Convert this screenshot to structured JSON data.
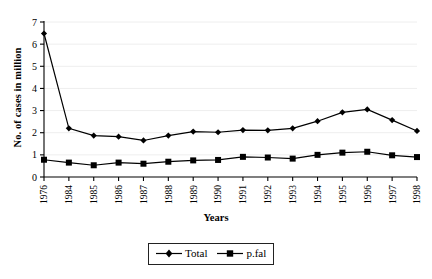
{
  "chart_data": {
    "type": "line",
    "title": "",
    "subtitle": "",
    "xlabel": "Years",
    "ylabel": "No. of cases in million",
    "categories": [
      "1976",
      "1984",
      "1985",
      "1986",
      "1987",
      "1988",
      "1989",
      "1990",
      "1991",
      "1992",
      "1993",
      "1994",
      "1995",
      "1996",
      "1997",
      "1998"
    ],
    "series": [
      {
        "name": "Total",
        "marker": "diamond",
        "color": "#000000",
        "values": [
          6.48,
          2.2,
          1.87,
          1.82,
          1.65,
          1.87,
          2.05,
          2.02,
          2.12,
          2.11,
          2.2,
          2.52,
          2.92,
          3.05,
          2.57,
          2.08
        ]
      },
      {
        "name": "p.fal",
        "marker": "square",
        "color": "#000000",
        "values": [
          0.78,
          0.65,
          0.53,
          0.65,
          0.6,
          0.69,
          0.75,
          0.77,
          0.91,
          0.88,
          0.83,
          1.0,
          1.1,
          1.14,
          0.98,
          0.9
        ]
      }
    ],
    "ylim": [
      0,
      7
    ],
    "yticks": [
      "0",
      "1",
      "2",
      "3",
      "4",
      "5",
      "6",
      "7"
    ],
    "grid": "horizontal-light",
    "legend_position": "bottom-center",
    "axis_color": "#000000",
    "gridline_color": "#eeeeee",
    "background": "#ffffff"
  },
  "legend": {
    "entries": [
      {
        "label": "Total"
      },
      {
        "label": "p.fal"
      }
    ]
  }
}
